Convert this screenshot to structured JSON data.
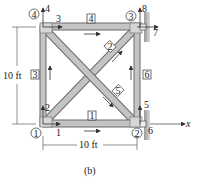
{
  "figure": {
    "caption": "(b)",
    "dimensions": {
      "height_label": "10 ft",
      "width_label": "10 ft"
    },
    "axis_label": "x",
    "nodes": [
      {
        "id": "1",
        "label": "1",
        "x": 43,
        "y": 124
      },
      {
        "id": "2",
        "label": "2",
        "x": 137,
        "y": 124
      },
      {
        "id": "3",
        "label": "3",
        "x": 137,
        "y": 27
      },
      {
        "id": "4",
        "label": "4",
        "x": 43,
        "y": 27
      }
    ],
    "node_circle_labels": {
      "n1": "1",
      "n2": "2",
      "n3": "3",
      "n4": "4"
    },
    "members": [
      {
        "id": "1",
        "label": "1",
        "from": "1",
        "to": "2"
      },
      {
        "id": "2",
        "label": "2",
        "from": "1",
        "to": "3"
      },
      {
        "id": "3",
        "label": "3",
        "from": "1",
        "to": "4"
      },
      {
        "id": "4",
        "label": "4",
        "from": "4",
        "to": "3"
      },
      {
        "id": "5",
        "label": "5",
        "from": "4",
        "to": "2"
      },
      {
        "id": "6",
        "label": "6",
        "from": "2",
        "to": "3"
      }
    ],
    "member_labels": {
      "m1": "1",
      "m2": "2",
      "m3": "3",
      "m4": "4",
      "m5": "5",
      "m6": "6"
    },
    "dof_labels": {
      "d1": "1",
      "d2": "2",
      "d3": "3",
      "d4": "4",
      "d5": "5",
      "d6": "6",
      "d7": "7",
      "d8": "8"
    },
    "colors": {
      "member_fill": "#b8b8b8",
      "member_edge": "#6a6a6a",
      "line": "#333333",
      "wall": "#8a8a8a"
    }
  }
}
